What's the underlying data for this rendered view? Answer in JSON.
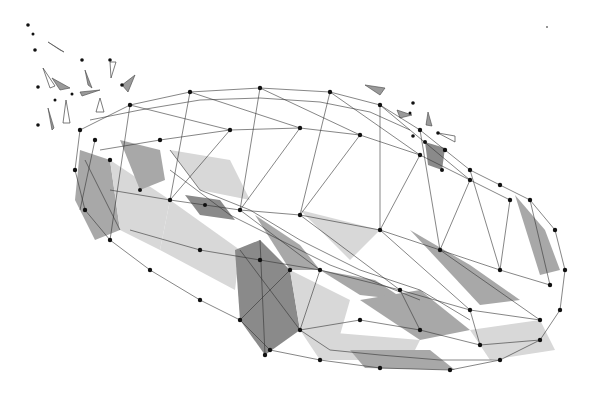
{
  "image": {
    "subject": "low-poly wireframe sports car",
    "style": "polygonal mesh with dark nodes and gray shaded facets",
    "background": "#ffffff",
    "colors": {
      "edge": "#333333",
      "node": "#111111",
      "light_facet": "#d8d8d8",
      "mid_facet": "#a8a8a8",
      "dark_facet": "#8a8a8a"
    }
  }
}
